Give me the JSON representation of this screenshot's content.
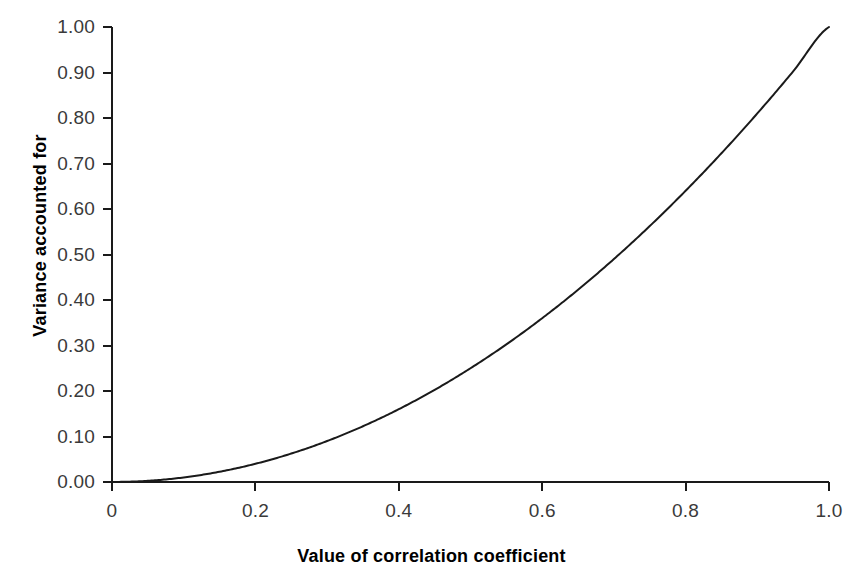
{
  "chart_data": {
    "type": "line",
    "title": "",
    "subtitle": "",
    "xlabel": "Value of correlation coefficient",
    "ylabel": "Variance accounted for",
    "xlim": [
      0,
      1.0
    ],
    "ylim": [
      0.0,
      1.0
    ],
    "grid": false,
    "legend": "none",
    "annotations": [],
    "relationship": "y = x^2 (proportion of variance accounted for equals the square of the correlation coefficient)",
    "series": [
      {
        "name": "Variance accounted for",
        "color": "#1a1a1a",
        "x": [
          0.0,
          0.05,
          0.1,
          0.15,
          0.2,
          0.25,
          0.3,
          0.35,
          0.4,
          0.45,
          0.5,
          0.55,
          0.6,
          0.65,
          0.7,
          0.75,
          0.8,
          0.85,
          0.9,
          0.95,
          1.0
        ],
        "values": [
          0.0,
          0.0025,
          0.01,
          0.0225,
          0.04,
          0.0625,
          0.09,
          0.1225,
          0.16,
          0.2025,
          0.25,
          0.3025,
          0.36,
          0.4225,
          0.49,
          0.5625,
          0.64,
          0.7225,
          0.81,
          0.9025,
          1.0
        ]
      }
    ],
    "x_ticks": [
      {
        "value": 0.0,
        "label": "0"
      },
      {
        "value": 0.2,
        "label": "0.2"
      },
      {
        "value": 0.4,
        "label": "0.4"
      },
      {
        "value": 0.6,
        "label": "0.6"
      },
      {
        "value": 0.8,
        "label": "0.8"
      },
      {
        "value": 1.0,
        "label": "1.0"
      }
    ],
    "y_ticks": [
      {
        "value": 0.0,
        "label": "0.00"
      },
      {
        "value": 0.1,
        "label": "0.10"
      },
      {
        "value": 0.2,
        "label": "0.20"
      },
      {
        "value": 0.3,
        "label": "0.30"
      },
      {
        "value": 0.4,
        "label": "0.40"
      },
      {
        "value": 0.5,
        "label": "0.50"
      },
      {
        "value": 0.6,
        "label": "0.60"
      },
      {
        "value": 0.7,
        "label": "0.70"
      },
      {
        "value": 0.8,
        "label": "0.80"
      },
      {
        "value": 0.9,
        "label": "0.90"
      },
      {
        "value": 1.0,
        "label": "1.00"
      }
    ]
  },
  "style": {
    "background": "#ffffff",
    "axis_color": "#1a1a1a",
    "curve_color": "#1a1a1a",
    "tick_label_color": "#3a3a3a",
    "title_color": "#000000"
  },
  "geometry": {
    "plot_left": 112,
    "plot_right": 829,
    "plot_top": 27,
    "plot_bottom": 482
  }
}
